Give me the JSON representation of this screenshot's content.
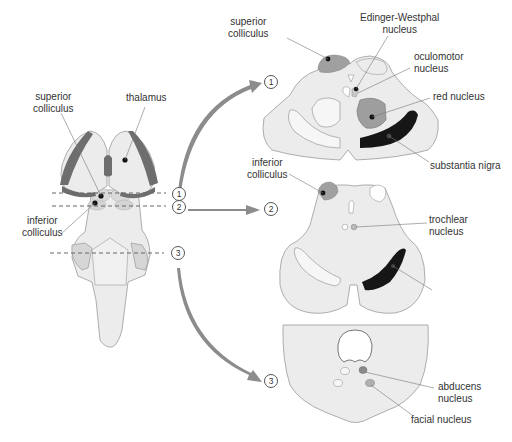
{
  "colors": {
    "tissue_fill": "#ececec",
    "tissue_stroke": "#9a9a9a",
    "medium_gray": "#9e9e9e",
    "dark_gray": "#6e6e6e",
    "black": "#111111",
    "arrow": "#8c8c8c",
    "light_gray": "#d2d2d2"
  },
  "brainstem_view": {
    "labels": {
      "superior_colliculus": [
        "superior",
        "colliculus"
      ],
      "thalamus": "thalamus",
      "inferior_colliculus": [
        "inferior",
        "colliculus"
      ]
    },
    "section_lines": [
      {
        "number": "1"
      },
      {
        "number": "2"
      },
      {
        "number": "3"
      }
    ]
  },
  "sections": [
    {
      "number": "1",
      "labels": {
        "superior_colliculus": [
          "superior",
          "colliculus"
        ],
        "edinger_westphal": [
          "Edinger-Westphal",
          "nucleus"
        ],
        "oculomotor": [
          "oculomotor",
          "nucleus"
        ],
        "red_nucleus": "red nucleus",
        "substantia_nigra": "substantia nigra"
      }
    },
    {
      "number": "2",
      "labels": {
        "inferior_colliculus": [
          "inferior",
          "colliculus"
        ],
        "trochlear": [
          "trochlear",
          "nucleus"
        ]
      }
    },
    {
      "number": "3",
      "labels": {
        "abducens": [
          "abducens",
          "nucleus"
        ],
        "facial": "facial nucleus"
      }
    }
  ]
}
